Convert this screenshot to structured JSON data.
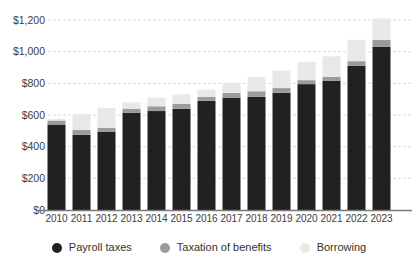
{
  "chart_data": {
    "type": "bar",
    "stacked": true,
    "title": "",
    "xlabel": "",
    "ylabel": "",
    "ylim": [
      0,
      1200
    ],
    "grid": "dashed-horizontal",
    "legend_position": "bottom",
    "categories": [
      "2010",
      "2011",
      "2012",
      "2013",
      "2014",
      "2015",
      "2016",
      "2017",
      "2018",
      "2019",
      "2020",
      "2021",
      "2022",
      "2023"
    ],
    "series": [
      {
        "name": "Payroll taxes",
        "color": "#212121",
        "values": [
          540,
          475,
          495,
          615,
          625,
          640,
          690,
          710,
          715,
          740,
          795,
          815,
          910,
          1030
        ]
      },
      {
        "name": "Taxation of benefits",
        "color": "#9b9b9b",
        "values": [
          25,
          30,
          25,
          25,
          30,
          30,
          25,
          30,
          35,
          30,
          25,
          25,
          30,
          45
        ]
      },
      {
        "name": "Borrowing",
        "color": "#e8e8e6",
        "values": [
          10,
          100,
          125,
          40,
          55,
          60,
          45,
          60,
          90,
          110,
          115,
          130,
          135,
          135
        ]
      }
    ],
    "yticks": [
      {
        "value": 0,
        "label": "$0"
      },
      {
        "value": 200,
        "label": "$200"
      },
      {
        "value": 400,
        "label": "$400"
      },
      {
        "value": 600,
        "label": "$600"
      },
      {
        "value": 800,
        "label": "$800"
      },
      {
        "value": 1000,
        "label": "$1,000"
      },
      {
        "value": 1200,
        "label": "$1,200"
      }
    ],
    "colors": {
      "axis_line": "#7a7a7a",
      "gridline": "#d9d9d9",
      "tick_text": "#3d3d3d",
      "background": "#ffffff"
    }
  }
}
